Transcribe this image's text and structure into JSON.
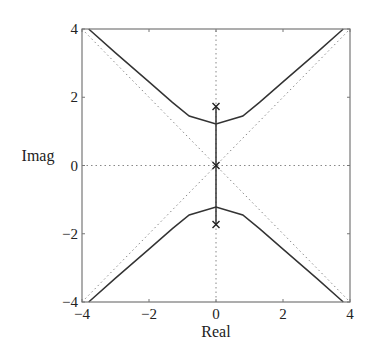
{
  "chart_data": {
    "type": "line",
    "title": "",
    "xlabel": "Real",
    "ylabel": "Imag",
    "xlim": [
      -4,
      4
    ],
    "ylim": [
      -4,
      4
    ],
    "xticks": [
      -4,
      -2,
      0,
      2,
      4
    ],
    "yticks": [
      -4,
      -2,
      0,
      2,
      4
    ],
    "xtick_labels": [
      "−4",
      "−2",
      "0",
      "2",
      "4"
    ],
    "ytick_labels": [
      "−4",
      "−2",
      "0",
      "2",
      "4"
    ],
    "grid": false,
    "series": [
      {
        "name": "root-locus-upper",
        "style": "solid",
        "points": [
          [
            -3.8,
            4.0
          ],
          [
            -3.0,
            3.3
          ],
          [
            -2.0,
            2.45
          ],
          [
            -1.3,
            1.85
          ],
          [
            -0.8,
            1.45
          ],
          [
            0.0,
            1.22
          ],
          [
            0.8,
            1.45
          ],
          [
            1.3,
            1.85
          ],
          [
            2.0,
            2.45
          ],
          [
            3.0,
            3.3
          ],
          [
            3.8,
            4.0
          ]
        ]
      },
      {
        "name": "root-locus-lower",
        "style": "solid",
        "points": [
          [
            -3.8,
            -4.0
          ],
          [
            -3.0,
            -3.3
          ],
          [
            -2.0,
            -2.45
          ],
          [
            -1.3,
            -1.85
          ],
          [
            -0.8,
            -1.45
          ],
          [
            0.0,
            -1.22
          ],
          [
            0.8,
            -1.45
          ],
          [
            1.3,
            -1.85
          ],
          [
            2.0,
            -2.45
          ],
          [
            3.0,
            -3.3
          ],
          [
            3.8,
            -4.0
          ]
        ]
      },
      {
        "name": "root-locus-imag-axis",
        "style": "solid",
        "points": [
          [
            0.0,
            -1.73
          ],
          [
            0.0,
            1.73
          ]
        ]
      }
    ],
    "asymptotes": [
      {
        "name": "asymptote-pos",
        "points": [
          [
            -4,
            -4
          ],
          [
            4,
            4
          ]
        ]
      },
      {
        "name": "asymptote-neg",
        "points": [
          [
            -4,
            4
          ],
          [
            4,
            -4
          ]
        ]
      }
    ],
    "reference_lines": [
      {
        "name": "real-axis-line",
        "points": [
          [
            -4,
            0
          ],
          [
            4,
            0
          ]
        ]
      },
      {
        "name": "imag-axis-line",
        "points": [
          [
            0,
            -4
          ],
          [
            0,
            4
          ]
        ]
      }
    ],
    "poles": [
      [
        0.0,
        1.73
      ],
      [
        0.0,
        0.0
      ],
      [
        0.0,
        -1.73
      ]
    ],
    "colors": {
      "locus": "#333333",
      "dotted": "#888888",
      "axes": "#777777"
    }
  }
}
